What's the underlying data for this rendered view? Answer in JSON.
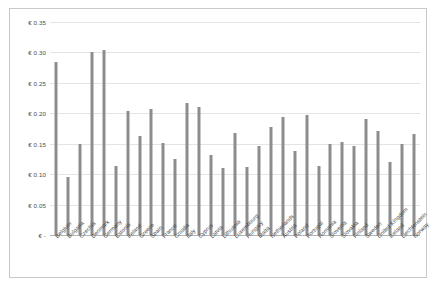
{
  "chart_data": {
    "type": "bar",
    "title": "",
    "subtitle": "",
    "xlabel": "",
    "ylabel": "",
    "ylim": [
      0,
      0.35
    ],
    "ytick_values": [
      0,
      0.05,
      0.1,
      0.15,
      0.2,
      0.25,
      0.3,
      0.35
    ],
    "ytick_labels": [
      "€  -",
      "€ 0.05",
      "€ 0.10",
      "€ 0.15",
      "€ 0.20",
      "€ 0.25",
      "€ 0.30",
      "€ 0.35"
    ],
    "grid": true,
    "legend": false,
    "legend_position": "none",
    "currency_symbol": "€",
    "bar_color": "#8d8d8d",
    "gridline_color": "#e4e4e4",
    "border_color": "#c9c9c9",
    "categories": [
      "Belgium",
      "Bulgaria",
      "Czechia",
      "Denmark",
      "Germany",
      "Estonia",
      "Ireland",
      "Greece",
      "Spain",
      "France",
      "Croatia",
      "Italy",
      "Cyprus",
      "Latvia",
      "Lithuania",
      "Luxembourg",
      "Hungary",
      "Malta",
      "Netherlands",
      "Austria",
      "Poland",
      "Portugal",
      "Romania",
      "Slovenia",
      "Slovakia",
      "Finland",
      "Sweden",
      "United Kingdom",
      "Iceland",
      "Liechtenstein",
      "Norway"
    ],
    "values": [
      0.285,
      0.096,
      0.15,
      0.301,
      0.304,
      0.114,
      0.203,
      0.162,
      0.207,
      0.152,
      0.125,
      0.217,
      0.211,
      0.132,
      0.11,
      0.168,
      0.112,
      0.147,
      0.177,
      0.194,
      0.138,
      0.197,
      0.114,
      0.149,
      0.153,
      0.146,
      0.19,
      0.171,
      0.12,
      0.149,
      0.166
    ]
  }
}
